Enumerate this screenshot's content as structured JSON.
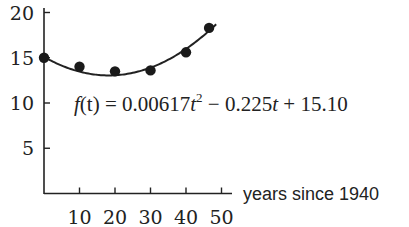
{
  "chart_data": {
    "type": "scatter",
    "title": "",
    "xlabel": "years since 1940",
    "ylabel": "",
    "xlim": [
      0,
      52
    ],
    "ylim": [
      0,
      21
    ],
    "grid": false,
    "x_ticks": [
      10,
      20,
      30,
      40,
      50
    ],
    "y_ticks": [
      5,
      10,
      15,
      20
    ],
    "x_tick_labels": [
      "10",
      "20",
      "30",
      "40",
      "50"
    ],
    "y_tick_labels": [
      "5",
      "10",
      "15",
      "20"
    ],
    "series": [
      {
        "name": "data",
        "type": "scatter",
        "x": [
          0,
          10,
          20,
          30,
          40,
          46.5
        ],
        "y": [
          15.0,
          14.0,
          13.5,
          13.6,
          15.6,
          18.3
        ]
      },
      {
        "name": "fit",
        "type": "line",
        "equation": "f(t) = 0.00617t^2 - 0.225t + 15.10",
        "coefficients": {
          "a": 0.00617,
          "b": -0.225,
          "c": 15.1
        },
        "t_range": [
          0,
          48.5
        ]
      }
    ],
    "annotations": [
      {
        "text_parts": [
          "f",
          "(t) = 0.00617",
          "t",
          "2",
          " − 0.225",
          "t",
          " + 15.10"
        ]
      }
    ]
  }
}
